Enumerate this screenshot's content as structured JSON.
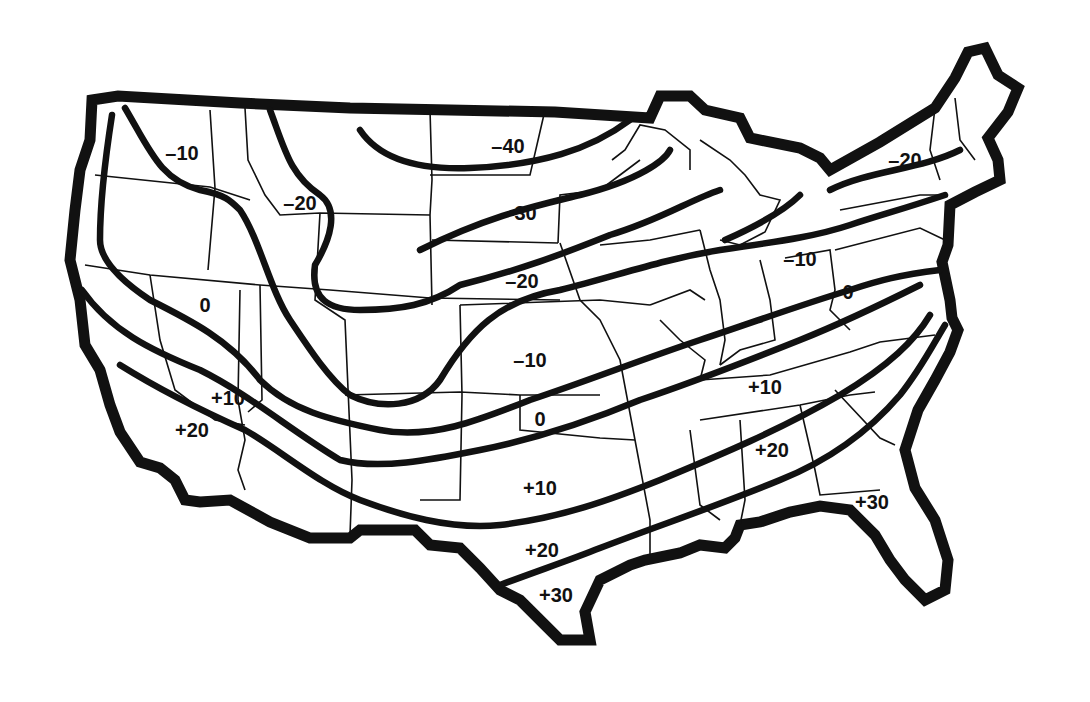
{
  "map": {
    "subject": "Continental United States isotherm map",
    "background_color": "#ffffff",
    "ink_color": "#111111",
    "isotherm_labels": [
      {
        "id": "nw-minus10",
        "text": "–10",
        "x": 182,
        "y": 155
      },
      {
        "id": "mt-minus20",
        "text": "–20",
        "x": 300,
        "y": 205
      },
      {
        "id": "nd-minus40",
        "text": "–40",
        "x": 508,
        "y": 148
      },
      {
        "id": "sd-minus30",
        "text": "–30",
        "x": 520,
        "y": 215
      },
      {
        "id": "ne-minus20",
        "text": "–20",
        "x": 522,
        "y": 283
      },
      {
        "id": "nv-zero",
        "text": "0",
        "x": 205,
        "y": 307
      },
      {
        "id": "ks-minus10",
        "text": "–10",
        "x": 530,
        "y": 362
      },
      {
        "id": "az-plus10",
        "text": "+10",
        "x": 228,
        "y": 400
      },
      {
        "id": "ca-plus20",
        "text": "+20",
        "x": 192,
        "y": 432
      },
      {
        "id": "ok-zero",
        "text": "0",
        "x": 540,
        "y": 421
      },
      {
        "id": "tx-plus10",
        "text": "+10",
        "x": 540,
        "y": 490
      },
      {
        "id": "tx-plus20",
        "text": "+20",
        "x": 542,
        "y": 552
      },
      {
        "id": "tx-plus30",
        "text": "+30",
        "x": 556,
        "y": 597
      },
      {
        "id": "tn-plus10",
        "text": "+10",
        "x": 765,
        "y": 389
      },
      {
        "id": "al-plus20",
        "text": "+20",
        "x": 772,
        "y": 452
      },
      {
        "id": "fl-plus30",
        "text": "+30",
        "x": 872,
        "y": 504
      },
      {
        "id": "oh-minus10",
        "text": "–10",
        "x": 800,
        "y": 261
      },
      {
        "id": "wv-zero",
        "text": "0",
        "x": 848,
        "y": 294
      },
      {
        "id": "ny-minus20",
        "text": "–20",
        "x": 905,
        "y": 162
      }
    ]
  }
}
